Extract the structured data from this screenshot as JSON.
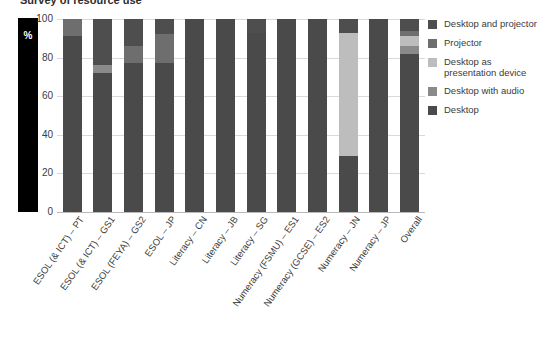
{
  "title": "Survey of resource use",
  "axis": {
    "y_unit_label": "%",
    "y_ticks": [
      100,
      80,
      60,
      40,
      20,
      0
    ],
    "ylim": [
      0,
      100
    ]
  },
  "legend": {
    "items": [
      {
        "label": "Desktop and projector",
        "color": "#4e4e4e"
      },
      {
        "label": "Projector",
        "color": "#6e6e6e"
      },
      {
        "label": "Desktop as presentation device",
        "color": "#bdbdbd"
      },
      {
        "label": "Desktop with audio",
        "color": "#8a8a8a"
      },
      {
        "label": "Desktop",
        "color": "#4a4a4a"
      }
    ]
  },
  "chart_data": {
    "type": "bar",
    "stacked": true,
    "title": "Survey of resource use",
    "xlabel": "",
    "ylabel": "%",
    "ylim": [
      0,
      100
    ],
    "grid": true,
    "legend_position": "right",
    "categories": [
      "ESOL (& ICT) – PT",
      "ESOL (& ICT) – GS1",
      "ESOL (FEYA) – GS2",
      "ESOL – JP",
      "Literacy – CN",
      "Literacy – JB",
      "Literacy – SG",
      "Numeracy (FSMU) – ES1",
      "Numeracy (GCSE) – ES2",
      "Numeracy – JN",
      "Numeracy – JP",
      "Overall"
    ],
    "series": [
      {
        "name": "Desktop",
        "color": "#4a4a4a",
        "values": [
          91,
          72,
          77,
          77,
          100,
          100,
          93,
          100,
          100,
          29,
          100,
          82
        ]
      },
      {
        "name": "Desktop with audio",
        "color": "#8a8a8a",
        "values": [
          0,
          4,
          0,
          0,
          0,
          0,
          0,
          0,
          0,
          0,
          0,
          4
        ]
      },
      {
        "name": "Desktop as presentation device",
        "color": "#bdbdbd",
        "values": [
          0,
          0,
          0,
          0,
          0,
          0,
          0,
          0,
          0,
          64,
          0,
          5
        ]
      },
      {
        "name": "Projector",
        "color": "#6e6e6e",
        "values": [
          9,
          0,
          9,
          15,
          0,
          0,
          0,
          0,
          0,
          0,
          0,
          3
        ]
      },
      {
        "name": "Desktop and projector",
        "color": "#4e4e4e",
        "values": [
          0,
          24,
          14,
          8,
          0,
          0,
          7,
          0,
          0,
          7,
          0,
          6
        ]
      }
    ]
  }
}
